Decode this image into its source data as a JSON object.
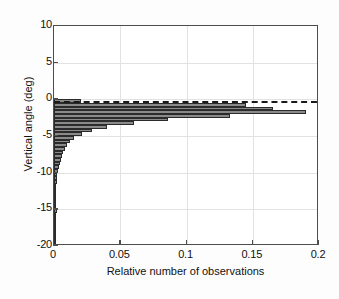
{
  "chart_data": {
    "type": "bar",
    "orientation": "horizontal",
    "title": "",
    "xlabel": "Relative number of observations",
    "ylabel": "Vertical angle (deg)",
    "xlim": [
      0,
      0.2
    ],
    "ylim": [
      -20,
      10
    ],
    "xticks": [
      "0",
      "0.05",
      "0.1",
      "0.15",
      "0.2"
    ],
    "xtick_values": [
      0,
      0.05,
      0.1,
      0.15,
      0.2
    ],
    "yticks": [
      "10",
      "5",
      "0",
      "-5",
      "-10",
      "-15",
      "-20"
    ],
    "ytick_values": [
      10,
      5,
      0,
      -5,
      -10,
      -15,
      -20
    ],
    "grid": true,
    "legend": "none",
    "bar_color": "#8a8a8a",
    "bar_edge_color": "#2b2b2b",
    "annotations": [
      {
        "name": "zero-reference-dashed-line",
        "type": "horizontal-dashed-line",
        "y": -0.25,
        "color": "#1a1a1a"
      }
    ],
    "categories": [
      -0.25,
      -0.75,
      -1.25,
      -1.75,
      -2.25,
      -2.75,
      -3.25,
      -3.75,
      -4.25,
      -4.75,
      -5.25,
      -5.75,
      -6.25,
      -6.75,
      -7.25,
      -7.75,
      -8.25,
      -8.75,
      -9.25,
      -9.75,
      -10.25,
      -10.75,
      -11.25,
      -11.75,
      -12.25,
      -12.75,
      -13.25,
      -13.75,
      -14.25,
      -14.75,
      -15.25,
      -15.75,
      -16.25,
      -16.75,
      -17.25,
      -17.75,
      -18.25,
      -18.75,
      -19.25,
      -19.75
    ],
    "values": [
      0.02,
      0.145,
      0.165,
      0.19,
      0.133,
      0.086,
      0.06,
      0.04,
      0.029,
      0.021,
      0.015,
      0.012,
      0.01,
      0.0085,
      0.007,
      0.006,
      0.005,
      0.0042,
      0.0036,
      0.003,
      0.0026,
      0.0022,
      0.0019,
      0.0016,
      0.0014,
      0.0012,
      0.0011,
      0.001,
      0.0009,
      0.0008,
      0.002,
      0.0008,
      0.0007,
      0.0007,
      0.0006,
      0.0006,
      0.0005,
      0.0005,
      0.0004,
      0.0004
    ]
  }
}
